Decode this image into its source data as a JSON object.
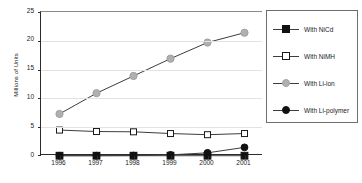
{
  "chart_data": {
    "type": "line",
    "title": "",
    "xlabel": "",
    "ylabel": "Millions of Units",
    "categories": [
      "1996",
      "1997",
      "1998",
      "1999",
      "2000",
      "2001"
    ],
    "ylim": [
      0,
      25
    ],
    "yticks": [
      0,
      5,
      10,
      15,
      20,
      25
    ],
    "grid": true,
    "legend_position": "right",
    "series": [
      {
        "name": "With NiCd",
        "marker": "square-filled",
        "color": "#111111",
        "values": [
          0.05,
          0.05,
          0.05,
          0.05,
          0.05,
          0.05
        ]
      },
      {
        "name": "With NiMH",
        "marker": "square-open",
        "color": "#1a1a1a",
        "values": [
          4.5,
          4.25,
          4.2,
          3.9,
          3.7,
          3.9
        ]
      },
      {
        "name": "With Li-ion",
        "marker": "circle-gray",
        "color": "#b0b0b0",
        "values": [
          7.3,
          10.9,
          13.9,
          16.9,
          19.7,
          21.4
        ]
      },
      {
        "name": "With Li-polymer",
        "marker": "circle-filled",
        "color": "#111111",
        "values": [
          0.05,
          0.05,
          0.08,
          0.2,
          0.55,
          1.5
        ]
      }
    ]
  },
  "legend": {
    "entries": [
      {
        "label": "With NiCd"
      },
      {
        "label": "With NiMH"
      },
      {
        "label": "With Li-ion"
      },
      {
        "label": "With Li-polymer"
      }
    ]
  },
  "colors": {
    "axis": "#2b2b2b",
    "grid": "#e2e2e2",
    "line": "#3d3d3d",
    "gray_marker": "#b0b0b0",
    "black_marker": "#111111",
    "legend_border": "#6f6f6f",
    "background": "#ffffff"
  }
}
